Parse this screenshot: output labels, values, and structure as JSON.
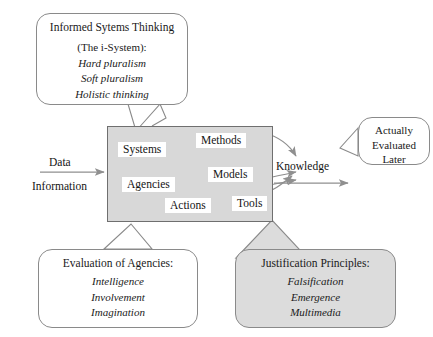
{
  "diagram": {
    "colors": {
      "core_box_fill": "#d8d8d8",
      "core_box_stroke": "#6f6f6f",
      "shaded_callout_fill": "#dcdcdc",
      "callout_stroke": "#8a8a8a",
      "line_stroke": "#8f8f8f",
      "text": "#141414",
      "background": "#ffffff"
    }
  },
  "core": {
    "name": "central-process-box",
    "chips": [
      {
        "id": "systems",
        "label": "Systems"
      },
      {
        "id": "methods",
        "label": "Methods"
      },
      {
        "id": "agencies",
        "label": "Agencies"
      },
      {
        "id": "models",
        "label": "Models"
      },
      {
        "id": "actions",
        "label": "Actions"
      },
      {
        "id": "tools",
        "label": "Tools"
      }
    ]
  },
  "flow": {
    "input_top": "Data",
    "input_bottom": "Information",
    "output": "Knowledge"
  },
  "callouts": {
    "informed_systems_thinking": {
      "title": "Informed Sytems Thinking",
      "subtitle": "(The i-System):",
      "items": [
        "Hard pluralism",
        "Soft pluralism",
        "Holistic thinking"
      ]
    },
    "actually_evaluated_later": {
      "lines": [
        "Actually",
        "Evaluated",
        "Later"
      ]
    },
    "evaluation_of_agencies": {
      "title": "Evaluation of Agencies:",
      "items": [
        "Intelligence",
        "Involvement",
        "Imagination"
      ]
    },
    "justification_principles": {
      "title": "Justification Principles:",
      "items": [
        "Falsification",
        "Emergence",
        "Multimedia"
      ]
    }
  }
}
